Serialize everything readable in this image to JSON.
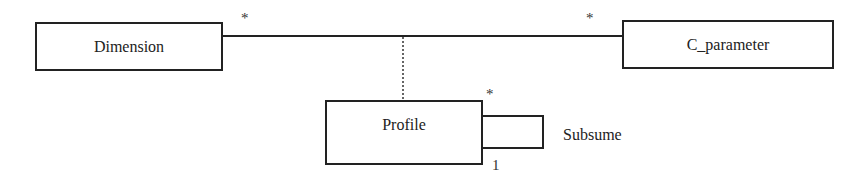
{
  "diagram": {
    "type": "UML class diagram",
    "classes": [
      {
        "id": "dimension",
        "name": "Dimension"
      },
      {
        "id": "c_parameter",
        "name": "C_parameter"
      },
      {
        "id": "profile",
        "name": "Profile"
      }
    ],
    "associations": [
      {
        "from": "Dimension",
        "to": "C_parameter",
        "from_multiplicity": "*",
        "to_multiplicity": "*",
        "association_class": "Profile"
      },
      {
        "from": "Profile",
        "to": "Profile",
        "name": "Subsume",
        "from_multiplicity": "*",
        "to_multiplicity": "1"
      }
    ],
    "labels": {
      "dimension": "Dimension",
      "c_parameter": "C_parameter",
      "profile": "Profile",
      "subsume": "Subsume",
      "mult_dimension": "*",
      "mult_c_parameter": "*",
      "mult_profile_star": "*",
      "mult_profile_one": "1"
    }
  }
}
